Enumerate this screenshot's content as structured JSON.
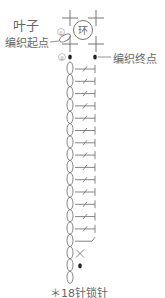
{
  "diagram": {
    "title": "叶子",
    "start_label": "编织起点",
    "end_label": "编织终点",
    "ring_label": "环",
    "step_markers": [
      "①",
      "②"
    ],
    "note": "＊18针锁针",
    "chain_count": 18,
    "stitch_rows": [
      "dc",
      "dc",
      "dc",
      "dc",
      "dc",
      "dc",
      "dc",
      "dc",
      "dc",
      "dc",
      "dc",
      "dc",
      "dc",
      "dc",
      "hdc",
      "sc",
      "slip"
    ],
    "colors": {
      "line": "#777777",
      "text": "#666666",
      "background": "#ffffff"
    }
  }
}
